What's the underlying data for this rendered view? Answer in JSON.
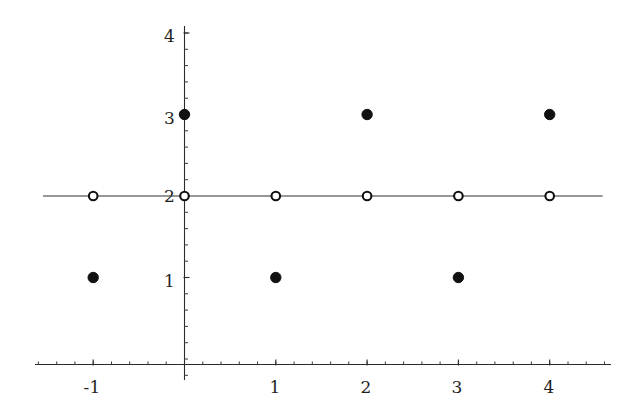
{
  "chart_data": {
    "type": "scatter",
    "title": "",
    "subtitle": "",
    "xlabel": "",
    "ylabel": "",
    "xlim": [
      -1.65,
      4.7
    ],
    "ylim": [
      -0.3,
      4.25
    ],
    "grid": false,
    "legend": null,
    "annotations": [],
    "x_ticks": [
      -1,
      1,
      2,
      3,
      4
    ],
    "x_tick_labels": [
      "-1",
      "1",
      "2",
      "3",
      "4"
    ],
    "y_ticks": [
      1,
      2,
      3,
      4
    ],
    "y_tick_labels": [
      "1",
      "2",
      "3",
      "4"
    ],
    "x_minor_tick_step": 0.2,
    "y_minor_tick_step": 0.2,
    "series": [
      {
        "name": "closed-points",
        "marker": "filled-circle",
        "color": "#111111",
        "points": [
          {
            "x": -1,
            "y": 1
          },
          {
            "x": 0,
            "y": 3
          },
          {
            "x": 1,
            "y": 1
          },
          {
            "x": 2,
            "y": 3
          },
          {
            "x": 3,
            "y": 1
          },
          {
            "x": 4,
            "y": 3
          }
        ]
      },
      {
        "name": "open-points",
        "marker": "open-circle",
        "color": "#111111",
        "points": [
          {
            "x": -1,
            "y": 2
          },
          {
            "x": 0,
            "y": 2
          },
          {
            "x": 1,
            "y": 2
          },
          {
            "x": 2,
            "y": 2
          },
          {
            "x": 3,
            "y": 2
          },
          {
            "x": 4,
            "y": 2
          }
        ]
      }
    ],
    "reference_line": {
      "name": "y-equals-2-line",
      "y": 2,
      "x_start": -1.55,
      "x_end": 4.58,
      "color": "#2e2e2e"
    }
  },
  "labels": {
    "x": {
      "t_neg1": "-1",
      "t_1": "1",
      "t_2": "2",
      "t_3": "3",
      "t_4": "4"
    },
    "y": {
      "t_1": "1",
      "t_2": "2",
      "t_3": "3",
      "t_4": "4"
    }
  }
}
